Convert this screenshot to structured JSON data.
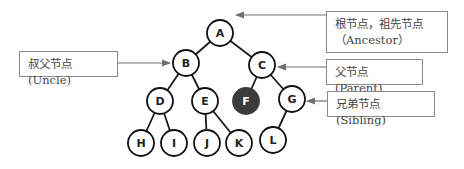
{
  "diagram": {
    "type": "binary-tree",
    "nodes": [
      {
        "id": "A",
        "x": 220,
        "y": 33,
        "highlighted": false
      },
      {
        "id": "B",
        "x": 186,
        "y": 63,
        "highlighted": false
      },
      {
        "id": "C",
        "x": 262,
        "y": 65,
        "highlighted": false
      },
      {
        "id": "D",
        "x": 160,
        "y": 101,
        "highlighted": false
      },
      {
        "id": "E",
        "x": 205,
        "y": 101,
        "highlighted": false
      },
      {
        "id": "F",
        "x": 246,
        "y": 101,
        "highlighted": true
      },
      {
        "id": "G",
        "x": 292,
        "y": 99,
        "highlighted": false
      },
      {
        "id": "H",
        "x": 141,
        "y": 143,
        "highlighted": false
      },
      {
        "id": "I",
        "x": 174,
        "y": 143,
        "highlighted": false
      },
      {
        "id": "J",
        "x": 207,
        "y": 143,
        "highlighted": false
      },
      {
        "id": "K",
        "x": 239,
        "y": 143,
        "highlighted": false
      },
      {
        "id": "L",
        "x": 273,
        "y": 140,
        "highlighted": false
      }
    ],
    "edges": [
      [
        "A",
        "B"
      ],
      [
        "A",
        "C"
      ],
      [
        "B",
        "D"
      ],
      [
        "B",
        "E"
      ],
      [
        "C",
        "F"
      ],
      [
        "C",
        "G"
      ],
      [
        "D",
        "H"
      ],
      [
        "D",
        "I"
      ],
      [
        "E",
        "J"
      ],
      [
        "E",
        "K"
      ],
      [
        "G",
        "L"
      ]
    ],
    "highlight_color": "#3c3c3c",
    "callouts": {
      "ancestor": {
        "line1": "根节点，祖先节点",
        "line2": "（Ancestor）",
        "target": "A"
      },
      "uncle": {
        "text": "叔父节点(Uncle)",
        "target": "B"
      },
      "parent": {
        "text": "父节点(Parent)",
        "target": "C"
      },
      "sibling": {
        "text": "兄弟节点(Sibling)",
        "target": "G"
      }
    }
  }
}
